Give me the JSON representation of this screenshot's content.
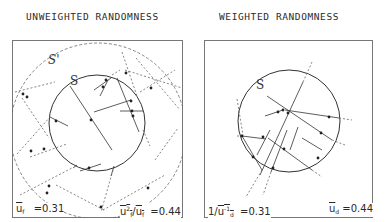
{
  "panels": [
    {
      "title": "UNWEIGHTED RANDOMNESS",
      "circle_label": "S",
      "outer_circle_label": "S'",
      "stat_left": {
        "symbol": "u",
        "subscript": "f",
        "equals": "=0.31"
      },
      "stat_right": {
        "symbol": "u",
        "superscript": "2",
        "subscript": "f",
        "divisor": "u",
        "divisor_subscript": "f",
        "equals": "=0.44"
      }
    },
    {
      "title": "WEIGHTED RANDOMNESS",
      "circle_label": "S",
      "stat_left": {
        "prefix": "1/",
        "symbol": "u",
        "superscript": "-1",
        "subscript": "d",
        "equals": "=0.31"
      },
      "stat_right": {
        "symbol": "u",
        "subscript": "d",
        "equals": "=0.44"
      }
    }
  ],
  "colors": {
    "line": "#3a3a3a",
    "dashed": "#666666",
    "box": "#777777"
  }
}
